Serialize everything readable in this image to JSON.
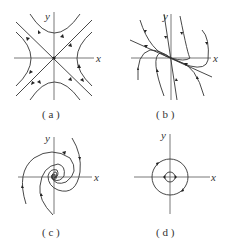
{
  "figure": {
    "panels": [
      {
        "id": "a",
        "label": "( a )",
        "x_axis_label": "x",
        "y_axis_label": "y",
        "type": "saddle point"
      },
      {
        "id": "b",
        "label": "( b )",
        "x_axis_label": "x",
        "y_axis_label": "y",
        "type": "degenerate node"
      },
      {
        "id": "c",
        "label": "( c )",
        "x_axis_label": "x",
        "y_axis_label": "y",
        "type": "stable spiral focus"
      },
      {
        "id": "d",
        "label": "( d )",
        "x_axis_label": "x",
        "y_axis_label": "y",
        "type": "center"
      }
    ]
  },
  "colors": {
    "line": "#333333",
    "axis": "#555555",
    "background": "#ffffff"
  }
}
